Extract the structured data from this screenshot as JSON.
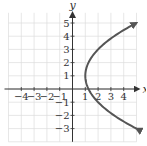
{
  "chart_data": {
    "type": "line",
    "title": "",
    "xlabel": "x",
    "ylabel": "y",
    "xlim": [
      -5,
      5
    ],
    "ylim": [
      -4,
      6
    ],
    "grid": true,
    "x_ticks": [
      -4,
      -3,
      -2,
      -1,
      1,
      2,
      3,
      4
    ],
    "y_ticks": [
      -3,
      -2,
      -1,
      1,
      2,
      3,
      4,
      5
    ],
    "x_tick_labels": [
      "−4",
      "−3",
      "−2",
      "−1",
      "1",
      "2",
      "3",
      "4"
    ],
    "y_tick_labels": [
      "−3",
      "−2",
      "−1",
      "1",
      "2",
      "3",
      "4",
      "5"
    ],
    "series": [
      {
        "name": "parabola opening right",
        "equation": "x = 1 + (y − 1)^2 / 4",
        "vertex": [
          1,
          1
        ],
        "arrows_at_ends": true,
        "points": [
          [
            5,
            -3
          ],
          [
            3.25,
            -2
          ],
          [
            2,
            -1
          ],
          [
            1.25,
            0
          ],
          [
            1,
            1
          ],
          [
            1.25,
            2
          ],
          [
            2,
            3
          ],
          [
            3.25,
            4
          ],
          [
            5,
            5
          ]
        ]
      }
    ],
    "colors": {
      "curve": "#555555",
      "axes": "#333333",
      "grid": "#dddddd"
    }
  }
}
